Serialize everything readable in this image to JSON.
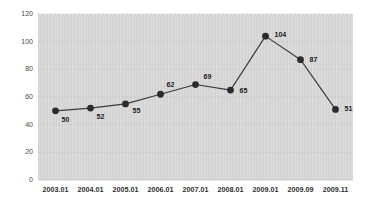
{
  "chart_data": {
    "type": "line",
    "title": "",
    "subtitle": "",
    "xlabel": "",
    "ylabel": "",
    "categories": [
      "2003.01",
      "2004.01",
      "2005.01",
      "2006.01",
      "2007.01",
      "2008.01",
      "2009.01",
      "2009.09",
      "2009.11"
    ],
    "values": [
      50,
      52,
      55,
      62,
      69,
      65,
      104,
      87,
      51
    ],
    "point_labels": [
      "50",
      "52",
      "55",
      "62",
      "69",
      "65",
      "104",
      "87",
      "51"
    ],
    "ylim": [
      0,
      120
    ],
    "yticks": [
      0,
      20,
      40,
      60,
      80,
      100,
      120
    ],
    "ytick_labels": [
      "0",
      "20",
      "40",
      "60",
      "80",
      "100",
      "120"
    ],
    "grid": "horizontal-dashed",
    "legend": "none",
    "series": [
      {
        "name": "",
        "values": [
          50,
          52,
          55,
          62,
          69,
          65,
          104,
          87,
          51
        ],
        "marker": "filled-circle",
        "marker_color": "#2b2b2b",
        "line_color": "#3a3a3a"
      }
    ],
    "colors": {
      "plot_background": "#d6d6d6",
      "page_background": "#ffffff",
      "grid": "#bdbdbd",
      "line": "#3a3a3a",
      "marker": "#2b2b2b",
      "axis_text": "#4a4a4a",
      "label_text": "#1a1a1a"
    },
    "label_offsets": [
      {
        "dx": 6,
        "dy": 11,
        "anchor": "start"
      },
      {
        "dx": 6,
        "dy": 11,
        "anchor": "start"
      },
      {
        "dx": 7,
        "dy": 9,
        "anchor": "start"
      },
      {
        "dx": 6,
        "dy": -7,
        "anchor": "start"
      },
      {
        "dx": 8,
        "dy": -6,
        "anchor": "start"
      },
      {
        "dx": 9,
        "dy": 3,
        "anchor": "start"
      },
      {
        "dx": 9,
        "dy": 1,
        "anchor": "start"
      },
      {
        "dx": 9,
        "dy": 2,
        "anchor": "start"
      },
      {
        "dx": 9,
        "dy": 2,
        "anchor": "start"
      }
    ]
  }
}
